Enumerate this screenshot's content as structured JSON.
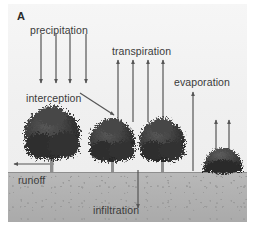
{
  "figure": {
    "panel_letter": "A",
    "background_color": "#f3f3f3",
    "sky_color": "#f0f0f0",
    "soil_color": "#b2b2b2",
    "arrow_color": "#555555",
    "tree_color": "#3a3a3a",
    "text_color": "#3a3a3a"
  },
  "labels": {
    "precipitation": "precipitation",
    "interception": "interception",
    "transpiration": "transpiration",
    "evaporation": "evaporation",
    "runoff": "runoff",
    "infiltration": "infiltration"
  },
  "diagram": {
    "type": "hydrological-cycle-schematic",
    "flows": [
      {
        "name": "precipitation",
        "direction": "down",
        "count": 4,
        "from_y": 38,
        "to_y": 85,
        "x_positions": [
          33,
          48,
          62,
          78
        ]
      },
      {
        "name": "interception",
        "direction": "diagonal-down-right",
        "count": 1,
        "from": [
          78,
          95
        ],
        "to": [
          113,
          118
        ]
      },
      {
        "name": "transpiration",
        "direction": "up",
        "count": 4,
        "from_y": 120,
        "to_y": 62,
        "x_positions": [
          118,
          133,
          148,
          163
        ]
      },
      {
        "name": "evaporation",
        "direction": "up",
        "count": 1,
        "from_y": 171,
        "to_y": 93,
        "x_positions": [
          192
        ]
      },
      {
        "name": "evaporation-bush",
        "direction": "up",
        "count": 2,
        "from_y": 150,
        "to_y": 122,
        "x_positions": [
          215,
          228
        ]
      },
      {
        "name": "runoff",
        "direction": "left",
        "count": 1,
        "from": [
          50,
          163
        ],
        "to": [
          14,
          163
        ]
      },
      {
        "name": "infiltration",
        "direction": "down",
        "count": 1,
        "from_y": 172,
        "to_y": 209,
        "x_positions": [
          137
        ]
      }
    ],
    "vegetation": [
      {
        "name": "tree-left",
        "cx": 52,
        "crown_cy": 137,
        "crown_rx": 28,
        "crown_ry": 27
      },
      {
        "name": "tree-middle",
        "cx": 113,
        "crown_cy": 143,
        "crown_rx": 23,
        "crown_ry": 22
      },
      {
        "name": "tree-right",
        "cx": 163,
        "crown_cy": 143,
        "crown_rx": 23,
        "crown_ry": 22
      },
      {
        "name": "bush-right",
        "cx": 222,
        "crown_cy": 166,
        "crown_rx": 20,
        "crown_ry": 16
      }
    ],
    "ground_line_y": 168
  }
}
